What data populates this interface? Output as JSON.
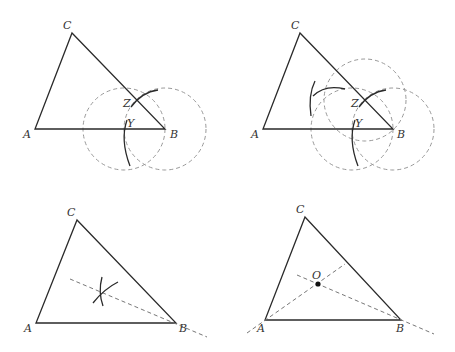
{
  "panels": [
    {
      "id": "panel-1",
      "labels": {
        "A": "A",
        "B": "B",
        "C": "C",
        "Z": "Z",
        "Y": "Y"
      },
      "vertices": {
        "A": [
          35,
          129
        ],
        "B": [
          165,
          129
        ],
        "C": [
          72,
          33
        ]
      },
      "circles": [
        {
          "cx": 124,
          "cy": 129,
          "r": 41
        },
        {
          "cx": 165,
          "cy": 129,
          "r": 41
        }
      ]
    },
    {
      "id": "panel-2",
      "labels": {
        "A": "A",
        "B": "B",
        "C": "C",
        "Z": "Z",
        "Y": "Y"
      },
      "vertices": {
        "A": [
          263,
          129
        ],
        "B": [
          393,
          129
        ],
        "C": [
          300,
          33
        ]
      },
      "circles": [
        {
          "cx": 352,
          "cy": 129,
          "r": 41
        },
        {
          "cx": 393,
          "cy": 129,
          "r": 41
        },
        {
          "cx": 365,
          "cy": 100,
          "r": 41
        }
      ]
    },
    {
      "id": "panel-3",
      "labels": {
        "A": "A",
        "B": "B",
        "C": "C"
      },
      "vertices": {
        "A": [
          36,
          323
        ],
        "B": [
          176,
          323
        ],
        "C": [
          77,
          220
        ]
      }
    },
    {
      "id": "panel-4",
      "labels": {
        "A": "A",
        "B": "B",
        "C": "C",
        "O": "O"
      },
      "vertices": {
        "A": [
          265,
          320
        ],
        "B": [
          401,
          320
        ],
        "C": [
          305,
          217
        ]
      },
      "point_O": [
        318,
        284
      ]
    }
  ]
}
